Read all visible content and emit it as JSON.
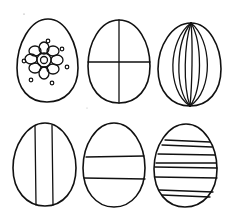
{
  "colors": {
    "background": "#ffffff",
    "line": "#111111"
  },
  "eggs": [
    {
      "id": "egg-1",
      "position": "top-left",
      "pattern": "flower-with-dots"
    },
    {
      "id": "egg-2",
      "position": "top-middle",
      "pattern": "cross-quarters"
    },
    {
      "id": "egg-3",
      "position": "top-right",
      "pattern": "vertical-meridians"
    },
    {
      "id": "egg-4",
      "position": "bottom-left",
      "pattern": "two-vertical-lines"
    },
    {
      "id": "egg-5",
      "position": "bottom-middle",
      "pattern": "horizontal-band"
    },
    {
      "id": "egg-6",
      "position": "bottom-right",
      "pattern": "horizontal-stripes"
    }
  ]
}
